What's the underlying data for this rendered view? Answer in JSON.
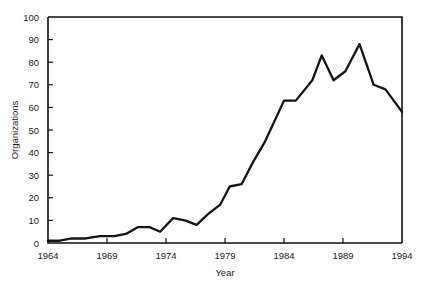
{
  "chart_data": {
    "type": "line",
    "title": "",
    "xlabel": "Year",
    "ylabel": "Organizations",
    "xlim": [
      1964,
      1994
    ],
    "ylim": [
      0,
      100
    ],
    "xticks": [
      1964,
      1969,
      1974,
      1979,
      1984,
      1989,
      1994
    ],
    "xtick_labels": [
      "1964",
      "1969",
      "1974",
      "1979",
      "1984",
      "1989",
      "1994"
    ],
    "yticks": [
      0,
      10,
      20,
      30,
      40,
      50,
      60,
      70,
      80,
      90,
      100
    ],
    "ytick_labels": [
      "0",
      "10",
      "20",
      "30",
      "40",
      "50",
      "60",
      "70",
      "80",
      "90",
      "100"
    ],
    "grid": false,
    "legend": false,
    "line_color": "#141414",
    "x": [
      1964,
      1965,
      1966,
      1967,
      1968,
      1969,
      1970,
      1971,
      1972,
      1973,
      1974,
      1975,
      1976,
      1977,
      1978,
      1979,
      1980,
      1981,
      1982,
      1983,
      1984,
      1985,
      1986,
      1987,
      1988,
      1989,
      1990,
      1991,
      1992,
      1993,
      1994
    ],
    "values": [
      1,
      1,
      2,
      2,
      2,
      3,
      4,
      6,
      7,
      7,
      5,
      11,
      10,
      8,
      13,
      17,
      25,
      26,
      36,
      45,
      54,
      63,
      63,
      72,
      83,
      76,
      72,
      80,
      88,
      70,
      68
    ],
    "series": [
      {
        "name": "Organizations",
        "values": [
          1,
          1,
          2,
          2,
          2,
          3,
          4,
          6,
          7,
          7,
          5,
          11,
          10,
          8,
          13,
          17,
          25,
          26,
          36,
          45,
          54,
          63,
          63,
          72,
          83,
          76,
          72,
          80,
          88,
          70,
          68
        ]
      }
    ],
    "points": [
      {
        "x": 1964.0,
        "y": 1
      },
      {
        "x": 1965.0,
        "y": 1
      },
      {
        "x": 1966.0,
        "y": 2
      },
      {
        "x": 1967.2,
        "y": 2
      },
      {
        "x": 1968.4,
        "y": 3
      },
      {
        "x": 1969.6,
        "y": 3
      },
      {
        "x": 1970.6,
        "y": 4
      },
      {
        "x": 1971.6,
        "y": 7
      },
      {
        "x": 1972.6,
        "y": 7
      },
      {
        "x": 1973.5,
        "y": 5
      },
      {
        "x": 1974.6,
        "y": 11
      },
      {
        "x": 1975.6,
        "y": 10
      },
      {
        "x": 1976.6,
        "y": 8
      },
      {
        "x": 1977.6,
        "y": 13
      },
      {
        "x": 1978.6,
        "y": 17
      },
      {
        "x": 1979.4,
        "y": 25
      },
      {
        "x": 1980.4,
        "y": 26
      },
      {
        "x": 1981.4,
        "y": 36
      },
      {
        "x": 1982.4,
        "y": 45
      },
      {
        "x": 1983.2,
        "y": 54
      },
      {
        "x": 1984.0,
        "y": 63
      },
      {
        "x": 1985.0,
        "y": 63
      },
      {
        "x": 1986.4,
        "y": 72
      },
      {
        "x": 1987.2,
        "y": 83
      },
      {
        "x": 1988.2,
        "y": 72
      },
      {
        "x": 1989.2,
        "y": 76
      },
      {
        "x": 1990.4,
        "y": 88
      },
      {
        "x": 1991.6,
        "y": 70
      },
      {
        "x": 1992.6,
        "y": 68
      },
      {
        "x": 1994.0,
        "y": 58
      }
    ]
  }
}
